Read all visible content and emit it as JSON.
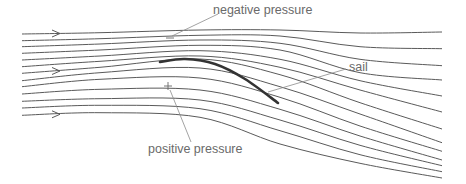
{
  "labels": {
    "negative_pressure": "negative pressure",
    "sail": "sail",
    "positive_pressure": "positive pressure"
  },
  "colors": {
    "streamline": "#5a5a5a",
    "sail": "#333333",
    "leader": "#8c8c8c",
    "text": "#6a6a6a"
  },
  "streamlines": [
    [
      [
        22,
        34
      ],
      [
        100,
        32.7
      ],
      [
        200,
        30
      ],
      [
        280,
        30
      ],
      [
        360,
        33
      ],
      [
        442,
        32
      ]
    ],
    [
      [
        22,
        40.7
      ],
      [
        100,
        38.7
      ],
      [
        200,
        35.3
      ],
      [
        280,
        36
      ],
      [
        360,
        46.7
      ],
      [
        442,
        48.7
      ]
    ],
    [
      [
        22,
        46.7
      ],
      [
        100,
        44
      ],
      [
        200,
        40
      ],
      [
        280,
        43.3
      ],
      [
        360,
        59.3
      ],
      [
        442,
        65.7
      ]
    ],
    [
      [
        22,
        53.3
      ],
      [
        100,
        50
      ],
      [
        200,
        45.3
      ],
      [
        280,
        50
      ],
      [
        360,
        72.7
      ],
      [
        442,
        80
      ]
    ],
    [
      [
        22,
        60
      ],
      [
        100,
        56
      ],
      [
        200,
        50.7
      ],
      [
        280,
        59.3
      ],
      [
        360,
        80.7
      ],
      [
        442,
        96
      ]
    ],
    [
      [
        22,
        66.7
      ],
      [
        100,
        61.3
      ],
      [
        200,
        56
      ],
      [
        280,
        67.3
      ],
      [
        360,
        90
      ],
      [
        442,
        112
      ]
    ],
    [
      [
        22,
        73.3
      ],
      [
        100,
        67.3
      ],
      [
        200,
        59
      ],
      [
        280,
        74.7
      ],
      [
        360,
        102.7
      ],
      [
        442,
        129
      ]
    ],
    [
      [
        22,
        80.7
      ],
      [
        100,
        72.7
      ],
      [
        200,
        68
      ],
      [
        280,
        86.7
      ],
      [
        360,
        114
      ],
      [
        442,
        142.7
      ]
    ],
    [
      [
        22,
        86.7
      ],
      [
        100,
        79.3
      ],
      [
        200,
        78
      ],
      [
        280,
        97.3
      ],
      [
        360,
        126
      ],
      [
        442,
        151.3
      ]
    ],
    [
      [
        22,
        94
      ],
      [
        100,
        89.3
      ],
      [
        200,
        90
      ],
      [
        280,
        109.3
      ],
      [
        360,
        136
      ],
      [
        442,
        160
      ]
    ],
    [
      [
        22,
        101.3
      ],
      [
        100,
        98.7
      ],
      [
        200,
        100
      ],
      [
        280,
        120
      ],
      [
        360,
        145.3
      ],
      [
        442,
        165.7
      ]
    ],
    [
      [
        22,
        108
      ],
      [
        100,
        105.3
      ],
      [
        200,
        108.7
      ],
      [
        280,
        130.7
      ],
      [
        360,
        154.7
      ],
      [
        442,
        171.7
      ]
    ],
    [
      [
        22,
        115.3
      ],
      [
        100,
        112.7
      ],
      [
        200,
        117.3
      ],
      [
        280,
        144
      ],
      [
        360,
        163.3
      ],
      [
        442,
        178
      ]
    ]
  ],
  "arrow_lines": [
    0,
    6,
    12
  ],
  "arrow_x": 52,
  "sail_curve": [
    [
      160,
      62
    ],
    [
      185,
      59
    ],
    [
      215,
      64
    ],
    [
      245,
      79
    ],
    [
      278,
      103
    ]
  ],
  "negative_sign": {
    "x": 170,
    "y": 38
  },
  "positive_sign": {
    "x": 168,
    "y": 86
  },
  "leaders": {
    "negative": [
      [
        172,
        36
      ],
      [
        218,
        14
      ]
    ],
    "sail": [
      [
        346,
        69
      ],
      [
        268,
        92
      ]
    ],
    "positive": [
      [
        170,
        90
      ],
      [
        191,
        142
      ]
    ]
  }
}
